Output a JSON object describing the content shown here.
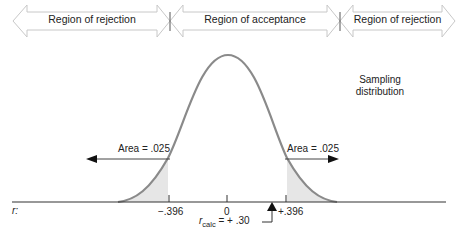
{
  "regions": [
    {
      "label": "Region of rejection",
      "from_x": -1,
      "to_x": -0.396
    },
    {
      "label": "Region of acceptance",
      "from_x": -0.396,
      "to_x": 0.396
    },
    {
      "label": "Region of rejection",
      "from_x": 0.396,
      "to_x": 1
    }
  ],
  "curve_label": {
    "line1": "Sampling",
    "line2": "distribution"
  },
  "tail_areas": {
    "left": "Area = .025",
    "right": "Area = .025"
  },
  "axis": {
    "variable": "r:",
    "ticks": [
      "−.396",
      "0",
      "+.396"
    ]
  },
  "observed": {
    "symbol": "r",
    "subscript": "calc",
    "value_text": "= + .30",
    "value": 0.3
  },
  "colors": {
    "curve": "#8a8a8a",
    "shade": "#e6e6e6",
    "arrow_outline": "#c8c8c8",
    "axis": "#333333"
  }
}
